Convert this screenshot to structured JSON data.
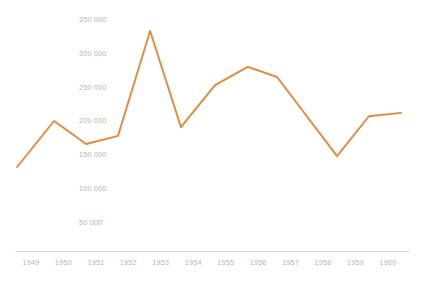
{
  "chart_data": {
    "type": "line",
    "title": "",
    "subtitle": "",
    "xlabel": "",
    "ylabel": "",
    "grid": false,
    "legend": "none",
    "legend_entries": [],
    "annotations": [],
    "line_color": "#e8883c",
    "axis_color": "#dcdcdc",
    "tick_label_color": "#b4b4b4",
    "background_color": "#ffffff",
    "xlim": [
      1948.5,
      1960.5
    ],
    "ylim": [
      0,
      360000
    ],
    "x_tick_labels": [
      "1949",
      "1950",
      "1951",
      "1952",
      "1953",
      "1954",
      "1955",
      "1956",
      "1957",
      "1958",
      "1959",
      "1960"
    ],
    "y_tick_labels": [
      "350 000",
      "300 000",
      "250 000",
      "200 000",
      "150 000",
      "100 000",
      "50 000"
    ],
    "y_tick_values": [
      350000,
      300000,
      250000,
      200000,
      150000,
      100000,
      50000
    ],
    "x": [
      1948.57,
      1949.71,
      1950.7,
      1951.68,
      1952.67,
      1953.62,
      1954.67,
      1955.68,
      1956.58,
      1958.43,
      1959.41,
      1960.4
    ],
    "values": [
      132000,
      200000,
      166000,
      178000,
      333000,
      191000,
      253000,
      280000,
      265000,
      148000,
      207000,
      212000
    ],
    "series": [
      {
        "name": "series-1",
        "color": "#e8883c",
        "values": [
          132000,
          200000,
          166000,
          178000,
          333000,
          191000,
          253000,
          280000,
          265000,
          148000,
          207000,
          212000
        ]
      }
    ]
  }
}
